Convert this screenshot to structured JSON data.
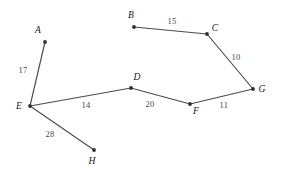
{
  "figure": {
    "width": 282,
    "height": 179,
    "background_color": "#ffffff",
    "edge_color": "#4a4a52",
    "vertex_color": "#2e2e36",
    "label_color": "#17171c"
  },
  "chart_data": {
    "type": "diagram",
    "subtype": "weighted-graph",
    "title": "",
    "xlabel": "",
    "ylabel": "",
    "grid": false,
    "legend": null,
    "nodes": [
      {
        "id": "A",
        "label": "A",
        "x": 45,
        "y": 42,
        "label_x": 38,
        "label_y": 31
      },
      {
        "id": "B",
        "label": "B",
        "x": 134,
        "y": 27,
        "label_x": 131,
        "label_y": 16
      },
      {
        "id": "C",
        "label": "C",
        "x": 207,
        "y": 34,
        "label_x": 215,
        "label_y": 29
      },
      {
        "id": "D",
        "label": "D",
        "x": 131,
        "y": 88,
        "label_x": 137,
        "label_y": 78
      },
      {
        "id": "E",
        "label": "E",
        "x": 30,
        "y": 106,
        "label_x": 19,
        "label_y": 107
      },
      {
        "id": "F",
        "label": "F",
        "x": 190,
        "y": 104,
        "label_x": 196,
        "label_y": 112
      },
      {
        "id": "G",
        "label": "G",
        "x": 253,
        "y": 89,
        "label_x": 262,
        "label_y": 90
      },
      {
        "id": "H",
        "label": "H",
        "x": 94,
        "y": 150,
        "label_x": 92,
        "label_y": 162
      }
    ],
    "edges": [
      {
        "id": "A-E",
        "source": "A",
        "target": "E",
        "weight": 17,
        "label": "17",
        "label_x": 23,
        "label_y": 70
      },
      {
        "id": "B-C",
        "source": "B",
        "target": "C",
        "weight": 15,
        "label": "15",
        "label_x": 172,
        "label_y": 21
      },
      {
        "id": "C-G",
        "source": "C",
        "target": "G",
        "weight": 10,
        "label": "10",
        "label_x": 236,
        "label_y": 57
      },
      {
        "id": "E-D",
        "source": "E",
        "target": "D",
        "weight": 14,
        "label": "14",
        "label_x": 86,
        "label_y": 105
      },
      {
        "id": "D-F",
        "source": "D",
        "target": "F",
        "weight": 20,
        "label": "20",
        "label_x": 150,
        "label_y": 104
      },
      {
        "id": "F-G",
        "source": "F",
        "target": "G",
        "weight": 11,
        "label": "11",
        "label_x": 224,
        "label_y": 105
      },
      {
        "id": "E-H",
        "source": "E",
        "target": "H",
        "weight": 28,
        "label": "28",
        "label_x": 50,
        "label_y": 134
      }
    ],
    "vertex_ids": [
      "A",
      "B",
      "C",
      "D",
      "E",
      "F",
      "G",
      "H"
    ],
    "weights": [
      17,
      15,
      10,
      14,
      20,
      11,
      28
    ],
    "edge_count": 7,
    "node_count": 8
  }
}
